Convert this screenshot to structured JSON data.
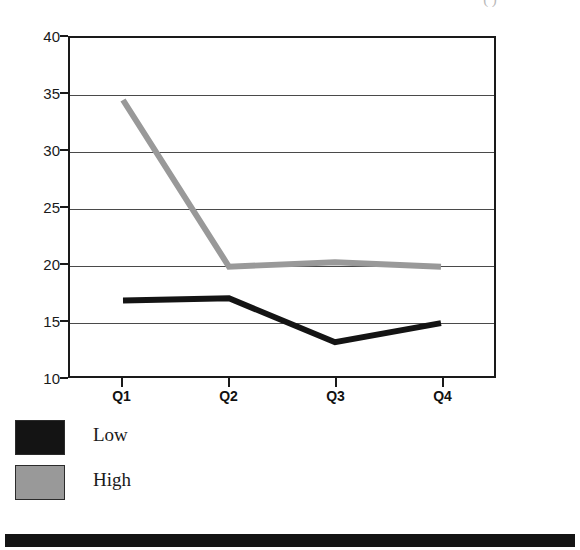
{
  "chart_data": {
    "type": "line",
    "title": "( )",
    "title_note": "title clipped at top edge of image; only parentheses visible",
    "xlabel": "",
    "ylabel": "",
    "categories": [
      "Q1",
      "Q2",
      "Q3",
      "Q4"
    ],
    "series": [
      {
        "name": "Low",
        "color": "#141414",
        "values": [
          16.7,
          16.9,
          13.0,
          14.7
        ]
      },
      {
        "name": "High",
        "color": "#999999",
        "values": [
          34.5,
          19.7,
          20.1,
          19.7
        ]
      }
    ],
    "ylim": [
      10,
      40
    ],
    "yticks": [
      10,
      15,
      20,
      25,
      30,
      35,
      40
    ],
    "ytick_labels": [
      "10",
      "15",
      "20",
      "25",
      "30",
      "35",
      "40"
    ],
    "grid": true,
    "grid_axis": "y",
    "legend_position": "below-left"
  },
  "legend": {
    "entries": [
      {
        "label": "Low",
        "color": "#141414"
      },
      {
        "label": "High",
        "color": "#999999"
      }
    ]
  },
  "colors": {
    "low": "#141414",
    "high": "#999999",
    "axis": "#1a1a1a",
    "grid": "#4a4a4a",
    "background": "#ffffff",
    "bottom_bar": "#141414"
  }
}
